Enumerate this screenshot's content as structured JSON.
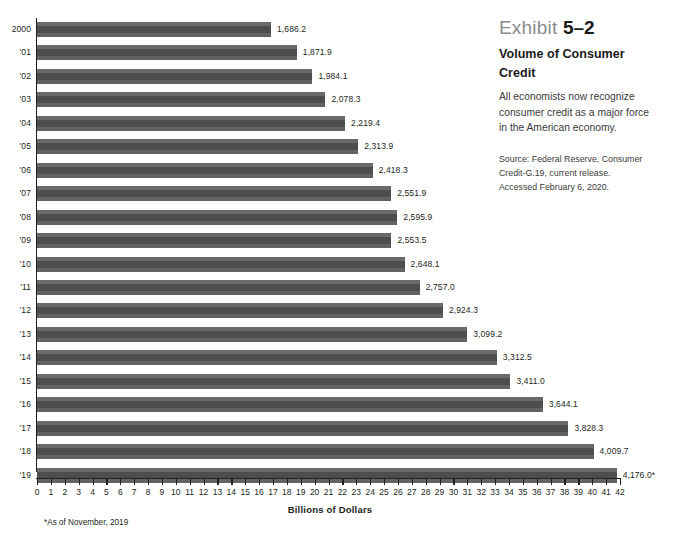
{
  "chart_data": {
    "type": "bar",
    "orientation": "horizontal",
    "title": "Volume of Consumer Credit",
    "xlabel": "Billions of Dollars",
    "ylabel": "",
    "xlim": [
      0,
      42
    ],
    "xticks": [
      0,
      1,
      2,
      3,
      4,
      5,
      6,
      7,
      8,
      9,
      10,
      11,
      12,
      13,
      14,
      15,
      16,
      17,
      18,
      19,
      20,
      21,
      22,
      23,
      24,
      25,
      26,
      27,
      28,
      29,
      30,
      31,
      32,
      33,
      34,
      35,
      36,
      37,
      38,
      39,
      40,
      41,
      42
    ],
    "grid": false,
    "legend": null,
    "value_unit": "hundreds of billions of dollars (axis); labels in billions",
    "categories": [
      "2000",
      "'01",
      "'02",
      "'03",
      "'04",
      "'05",
      "'06",
      "'07",
      "'08",
      "'09",
      "'10",
      "'11",
      "'12",
      "'13",
      "'14",
      "'15",
      "'16",
      "'17",
      "'18",
      "'19"
    ],
    "values": [
      1686.2,
      1871.9,
      1984.1,
      2078.3,
      2219.4,
      2313.9,
      2418.3,
      2551.9,
      2595.9,
      2553.5,
      2648.1,
      2757.0,
      2924.3,
      3099.2,
      3312.5,
      3411.0,
      3644.1,
      3828.3,
      4009.7,
      4176.0
    ],
    "value_labels": [
      "1,686.2",
      "1,871.9",
      "1,984.1",
      "2,078.3",
      "2,219.4",
      "2,313.9",
      "2,418.3",
      "2,551.9",
      "2,595.9",
      "2,553.5",
      "2,648.1",
      "2,757.0",
      "2,924.3",
      "3,099.2",
      "3,312.5",
      "3,411.0",
      "3,644.1",
      "3,828.3",
      "4,009.7",
      "4,176.0*"
    ],
    "footnote": "*As of November, 2019",
    "bar_color": "#5b5b5b"
  },
  "side_panel": {
    "exhibit_word": "Exhibit",
    "exhibit_number": "5–2",
    "title": "Volume of Consumer Credit",
    "body": "All economists now recognize consumer credit as a major force in the American economy.",
    "source": "Source: Federal Reserve, Consumer Credit-G.19, current release. Accessed February 6, 2020."
  }
}
